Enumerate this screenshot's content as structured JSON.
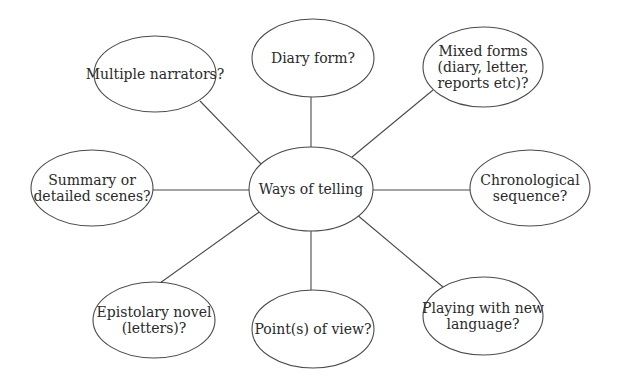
{
  "diagram": {
    "type": "mind-map",
    "colors": {
      "stroke": "#4a4a4a",
      "text": "#2a2a2a",
      "background": "#ffffff"
    },
    "center": {
      "id": "ways-of-telling",
      "lines": [
        "Ways of telling"
      ],
      "cx": 311,
      "cy": 189,
      "rx": 62,
      "ry": 42
    },
    "nodes": [
      {
        "id": "diary-form",
        "lines": [
          "Diary form?"
        ],
        "cx": 313,
        "cy": 58,
        "rx": 61,
        "ry": 39
      },
      {
        "id": "mixed-forms",
        "lines": [
          "Mixed forms",
          "(diary, letter,",
          "reports etc)?"
        ],
        "cx": 483,
        "cy": 67,
        "rx": 60,
        "ry": 40
      },
      {
        "id": "chronological-sequence",
        "lines": [
          "Chronological",
          "sequence?"
        ],
        "cx": 530,
        "cy": 188,
        "rx": 60,
        "ry": 38
      },
      {
        "id": "playing-with-new-language",
        "lines": [
          "Playing with new",
          "language?"
        ],
        "cx": 483,
        "cy": 316,
        "rx": 60,
        "ry": 39
      },
      {
        "id": "points-of-view",
        "lines": [
          "Point(s) of view?"
        ],
        "cx": 313,
        "cy": 329,
        "rx": 61,
        "ry": 39
      },
      {
        "id": "epistolary-novel",
        "lines": [
          "Epistolary novel",
          "(letters)?"
        ],
        "cx": 154,
        "cy": 320,
        "rx": 61,
        "ry": 38
      },
      {
        "id": "summary-or-detailed-scenes",
        "lines": [
          "Summary or",
          "detailed scenes?"
        ],
        "cx": 92,
        "cy": 188,
        "rx": 61,
        "ry": 38
      },
      {
        "id": "multiple-narrators",
        "lines": [
          "Multiple narrators?"
        ],
        "cx": 155,
        "cy": 74,
        "rx": 61,
        "ry": 38
      }
    ],
    "edges": [
      {
        "from": "ways-of-telling",
        "to": "diary-form",
        "x1": 311,
        "y1": 147,
        "x2": 311,
        "y2": 97
      },
      {
        "from": "ways-of-telling",
        "to": "mixed-forms",
        "x1": 352,
        "y1": 157,
        "x2": 433,
        "y2": 90
      },
      {
        "from": "ways-of-telling",
        "to": "chronological-sequence",
        "x1": 373,
        "y1": 190,
        "x2": 470,
        "y2": 190
      },
      {
        "from": "ways-of-telling",
        "to": "playing-with-new-language",
        "x1": 356,
        "y1": 214,
        "x2": 443,
        "y2": 287
      },
      {
        "from": "ways-of-telling",
        "to": "points-of-view",
        "x1": 311,
        "y1": 231,
        "x2": 311,
        "y2": 290
      },
      {
        "from": "ways-of-telling",
        "to": "epistolary-novel",
        "x1": 262,
        "y1": 210,
        "x2": 160,
        "y2": 283
      },
      {
        "from": "ways-of-telling",
        "to": "summary-or-detailed-scenes",
        "x1": 249,
        "y1": 190,
        "x2": 153,
        "y2": 190
      },
      {
        "from": "ways-of-telling",
        "to": "multiple-narrators",
        "x1": 262,
        "y1": 165,
        "x2": 200,
        "y2": 101
      }
    ]
  }
}
